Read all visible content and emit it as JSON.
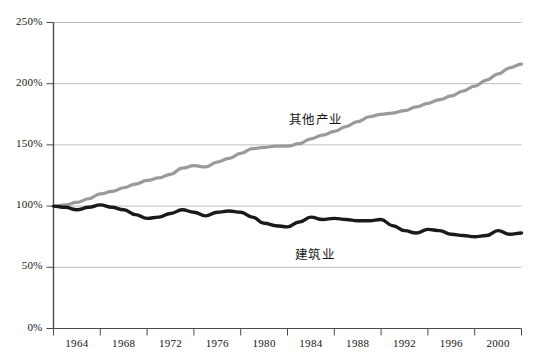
{
  "chart_data": {
    "type": "line",
    "title": "",
    "subtitle": "",
    "xlabel": "",
    "ylabel": "",
    "grid": true,
    "legend_position": "inline-annotation",
    "xlim": [
      1962,
      2002
    ],
    "ylim": [
      0,
      250
    ],
    "y_tick_labels": [
      "250%",
      "200%",
      "150%",
      "100%",
      "50%",
      "0%"
    ],
    "y_tick_values": [
      250,
      200,
      150,
      100,
      50,
      0
    ],
    "x_tick_labels": [
      "1964",
      "1968",
      "1972",
      "1976",
      "1980",
      "1984",
      "1988",
      "1992",
      "1996",
      "2000"
    ],
    "x_tick_values": [
      1964,
      1968,
      1972,
      1976,
      1980,
      1984,
      1988,
      1992,
      1996,
      2000
    ],
    "x": [
      1962,
      1963,
      1964,
      1965,
      1966,
      1967,
      1968,
      1969,
      1970,
      1971,
      1972,
      1973,
      1974,
      1975,
      1976,
      1977,
      1978,
      1979,
      1980,
      1981,
      1982,
      1983,
      1984,
      1985,
      1986,
      1987,
      1988,
      1989,
      1990,
      1991,
      1992,
      1993,
      1994,
      1995,
      1996,
      1997,
      1998,
      1999,
      2000,
      2001,
      2002
    ],
    "series": [
      {
        "name": "其他产业",
        "color": "#9a9a9a",
        "label_x": 1984.5,
        "label_y": 172,
        "values": [
          100,
          101,
          103,
          106,
          110,
          112,
          115,
          118,
          121,
          123,
          126,
          131,
          133,
          132,
          136,
          139,
          143,
          147,
          148,
          149,
          149,
          151,
          155,
          158,
          161,
          165,
          169,
          173,
          175,
          176,
          178,
          181,
          184,
          187,
          190,
          194,
          198,
          203,
          208,
          213,
          216
        ]
      },
      {
        "name": "建筑业",
        "color": "#1a1a1a",
        "label_x": 1985.0,
        "label_y": 62,
        "values": [
          100,
          99,
          97,
          99,
          101,
          99,
          97,
          93,
          90,
          91,
          94,
          97,
          95,
          92,
          95,
          96,
          95,
          91,
          86,
          84,
          83,
          87,
          91,
          89,
          90,
          89,
          88,
          88,
          89,
          84,
          80,
          78,
          81,
          80,
          77,
          76,
          75,
          76,
          80,
          77,
          78
        ]
      }
    ]
  },
  "axis": {
    "y_axis_name": "percent-axis",
    "x_axis_name": "year-axis"
  },
  "colors": {
    "gridline": "#b5b5b5",
    "axis": "#4a4a4a",
    "other_industry_line": "#9a9a9a",
    "construction_line": "#1a1a1a",
    "background": "#ffffff",
    "text": "#141414"
  }
}
